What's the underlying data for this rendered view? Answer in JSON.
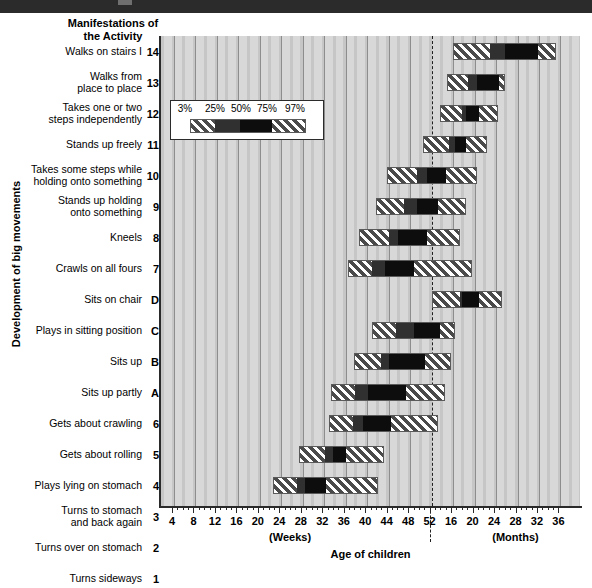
{
  "banner": {
    "present": true,
    "color": "#2b2b2b"
  },
  "chart_title": "Manifestations of\nthe Activity",
  "chart_title_line1": "Manifestations of",
  "chart_title_line2": "the Activity",
  "ylabel": "Development of big movements",
  "xlabel": "Age of children",
  "legend": {
    "labels": [
      "3%",
      "25%",
      "50%",
      "75%",
      "97%"
    ],
    "segments": [
      "hatch",
      "dark",
      "darker",
      "hatch"
    ]
  },
  "axis": {
    "weeks_ticks": [
      4,
      8,
      12,
      16,
      20,
      24,
      28,
      32,
      36,
      40,
      44,
      48,
      52
    ],
    "months_ticks": [
      16,
      20,
      24,
      28,
      32,
      36
    ],
    "weeks_unit_label": "(Weeks)",
    "months_unit_label": "(Months)",
    "divider_tick": 52
  },
  "chart_data": {
    "type": "bar",
    "title": "Manifestations of the Activity",
    "xlabel": "Age of children",
    "ylabel": "Development of big movements",
    "legend_position": "inside-upper-left",
    "grid": true,
    "x_unit_note": "tick index 0 = 4 weeks; ticks 0-12 are weeks (4..52, step 4); ticks 13-18 are months (16..36, step 4)",
    "xlim_tickindex": [
      -0.5,
      19.2
    ],
    "percentiles": [
      "3%",
      "25%",
      "50%",
      "75%",
      "97%"
    ],
    "categories": [
      {
        "code": "14",
        "label": "Walks on stairs I",
        "label_lines": [
          "Walks on stairs I"
        ]
      },
      {
        "code": "13",
        "label": "Walks from place to place",
        "label_lines": [
          "Walks from",
          "place to place"
        ]
      },
      {
        "code": "12",
        "label": "Takes one or two steps independently",
        "label_lines": [
          "Takes one or two",
          "steps independently"
        ]
      },
      {
        "code": "11",
        "label": "Stands up freely",
        "label_lines": [
          "Stands up freely"
        ]
      },
      {
        "code": "10",
        "label": "Takes some steps while holding onto something",
        "label_lines": [
          "Takes some steps while",
          "holding onto something"
        ]
      },
      {
        "code": "9",
        "label": "Stands up holding onto something",
        "label_lines": [
          "Stands up holding",
          "onto something"
        ]
      },
      {
        "code": "8",
        "label": "Kneels",
        "label_lines": [
          "Kneels"
        ]
      },
      {
        "code": "7",
        "label": "Crawls on all fours",
        "label_lines": [
          "Crawls on all fours"
        ]
      },
      {
        "code": "D",
        "label": "Sits on chair",
        "label_lines": [
          "Sits on chair"
        ]
      },
      {
        "code": "C",
        "label": "Plays in sitting position",
        "label_lines": [
          "Plays in sitting position"
        ]
      },
      {
        "code": "B",
        "label": "Sits up",
        "label_lines": [
          "Sits up"
        ]
      },
      {
        "code": "A",
        "label": "Sits up partly",
        "label_lines": [
          "Sits up partly"
        ]
      },
      {
        "code": "6",
        "label": "Gets about crawling",
        "label_lines": [
          "Gets about crawling"
        ]
      },
      {
        "code": "5",
        "label": "Gets about rolling",
        "label_lines": [
          "Gets about rolling"
        ]
      },
      {
        "code": "4",
        "label": "Plays lying on stomach",
        "label_lines": [
          "Plays lying on stomach"
        ]
      },
      {
        "code": "3",
        "label": "Turns to stomach and back again",
        "label_lines": [
          "Turns to stomach",
          "and back again"
        ]
      },
      {
        "code": "2",
        "label": "Turns over on stomach",
        "label_lines": [
          "Turns over on stomach"
        ]
      },
      {
        "code": "1",
        "label": "Turns sideways",
        "label_lines": [
          "Turns sideways"
        ]
      }
    ],
    "bars": [
      {
        "code": "14",
        "p3": 13.0,
        "p25": 14.7,
        "p50": 15.4,
        "p75": 17.0,
        "p97": 17.8
      },
      {
        "code": "13",
        "p3": 12.7,
        "p25": 13.7,
        "p50": 14.1,
        "p75": 15.2,
        "p97": 15.4
      },
      {
        "code": "12",
        "p3": 12.4,
        "p25": 13.4,
        "p50": 13.6,
        "p75": 14.2,
        "p97": 15.1
      },
      {
        "code": "11",
        "p3": 11.6,
        "p25": 12.8,
        "p50": 13.1,
        "p75": 13.6,
        "p97": 14.6
      },
      {
        "code": "10",
        "p3": 9.9,
        "p25": 11.3,
        "p50": 11.8,
        "p75": 12.7,
        "p97": 14.1
      },
      {
        "code": "9",
        "p3": 9.4,
        "p25": 10.7,
        "p50": 11.3,
        "p75": 12.3,
        "p97": 13.6
      },
      {
        "code": "8",
        "p3": 8.6,
        "p25": 10.0,
        "p50": 10.4,
        "p75": 11.8,
        "p97": 13.3
      },
      {
        "code": "7",
        "p3": 8.1,
        "p25": 9.2,
        "p50": 9.8,
        "p75": 11.2,
        "p97": 13.9
      },
      {
        "code": "D",
        "p3": 12.0,
        "p25": 13.3,
        "p50": 13.4,
        "p75": 14.2,
        "p97": 15.3
      },
      {
        "code": "C",
        "p3": 9.2,
        "p25": 10.3,
        "p50": 11.2,
        "p75": 12.4,
        "p97": 13.1
      },
      {
        "code": "B",
        "p3": 8.4,
        "p25": 9.6,
        "p50": 10.0,
        "p75": 11.7,
        "p97": 12.9
      },
      {
        "code": "A",
        "p3": 7.3,
        "p25": 8.4,
        "p50": 9.0,
        "p75": 10.8,
        "p97": 12.6
      },
      {
        "code": "6",
        "p3": 7.2,
        "p25": 8.3,
        "p50": 8.8,
        "p75": 10.1,
        "p97": 12.3
      },
      {
        "code": "5",
        "p3": 5.8,
        "p25": 7.0,
        "p50": 7.4,
        "p75": 8.0,
        "p97": 9.8
      },
      {
        "code": "4",
        "p3": 4.6,
        "p25": 5.7,
        "p50": 6.1,
        "p75": 7.1,
        "p97": 9.5
      },
      {
        "code": "3",
        "p3": 4.1,
        "p25": 5.4,
        "p50": 5.9,
        "p75": 7.0,
        "p97": 9.2
      },
      {
        "code": "2",
        "p3": 3.4,
        "p25": 4.7,
        "p50": 5.1,
        "p75": 5.9,
        "p97": 8.5
      },
      {
        "code": "1",
        "p3": 2.5,
        "p25": 3.6,
        "p50": 4.1,
        "p75": 4.8,
        "p97": 7.8
      }
    ]
  }
}
